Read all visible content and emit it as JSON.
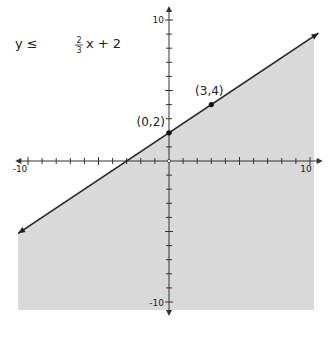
{
  "chart_data": {
    "type": "line",
    "title": "",
    "inequality": "y ≤ 2/3 x + 2",
    "inequality_display": {
      "lhs": "y ≤",
      "num": "2",
      "den": "3",
      "rhs": "x + 2"
    },
    "boundary_line": {
      "slope": 0.6667,
      "intercept": 2,
      "style": "solid"
    },
    "shaded_region": "below",
    "points": [
      {
        "x": 0,
        "y": 2,
        "label": "(0,2)"
      },
      {
        "x": 3,
        "y": 4,
        "label": "(3,4)"
      }
    ],
    "xlim": [
      -10,
      10
    ],
    "ylim": [
      -10,
      10
    ],
    "tick_step": 1,
    "x_tick_labels": [
      "-10",
      "10"
    ],
    "y_tick_labels": [
      "10",
      "-10"
    ],
    "xlabel": "",
    "ylabel": "",
    "grid": false,
    "colors": {
      "shade": "#d9d9d9",
      "line": "#222222",
      "axis": "#333333"
    }
  }
}
